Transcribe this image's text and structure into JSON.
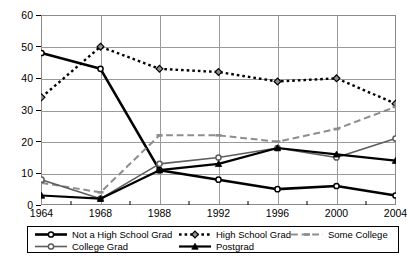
{
  "chart_data": {
    "type": "line",
    "title": "",
    "xlabel": "",
    "ylabel": "",
    "categories": [
      "1964",
      "1968",
      "1988",
      "1992",
      "1996",
      "2000",
      "2004"
    ],
    "x": [
      1964,
      1968,
      1988,
      1992,
      1996,
      2000,
      2004
    ],
    "ylim": [
      0,
      60
    ],
    "yticks": [
      0,
      10,
      20,
      30,
      40,
      50,
      60
    ],
    "ytick_labels": [
      "0",
      "10",
      "20",
      "30",
      "40",
      "50",
      "60"
    ],
    "grid": true,
    "legend_position": "bottom",
    "series": [
      {
        "name": "Not a High School Grad",
        "values": [
          48,
          43,
          11,
          8,
          5,
          6,
          3
        ],
        "color": "#000000",
        "line_style": "solid",
        "marker": "circle",
        "line_width": 2.6
      },
      {
        "name": "High School Grad",
        "values": [
          34,
          50,
          43,
          42,
          39,
          40,
          32
        ],
        "color": "#000000",
        "line_style": "dotted",
        "marker": "diamond",
        "line_width": 2.4
      },
      {
        "name": "Some College",
        "values": [
          7,
          4,
          22,
          22,
          20,
          24,
          31
        ],
        "color": "#8d8d8d",
        "line_style": "dashed",
        "marker": "dash",
        "line_width": 2.0
      },
      {
        "name": "College Grad",
        "values": [
          8,
          2,
          13,
          15,
          18,
          15,
          21
        ],
        "color": "#5d5d5d",
        "line_style": "solid",
        "marker": "circle",
        "line_width": 1.6
      },
      {
        "name": "Postgrad",
        "values": [
          3,
          2,
          11,
          13,
          18,
          16,
          14
        ],
        "color": "#000000",
        "line_style": "solid",
        "marker": "triangle",
        "line_width": 2.2
      }
    ]
  },
  "legend": {
    "rows": [
      [
        {
          "label": "Not a High School Grad",
          "series": 0
        },
        {
          "label": "High School Grad",
          "series": 1
        },
        {
          "label": "Some College",
          "series": 2
        }
      ],
      [
        {
          "label": "College Grad",
          "series": 3
        },
        {
          "label": "Postgrad",
          "series": 4
        }
      ]
    ]
  },
  "caption": {
    "text": ""
  }
}
